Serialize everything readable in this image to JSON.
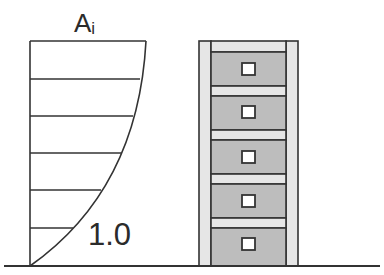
{
  "diagram": {
    "distribution_label": "A",
    "distribution_subscript": "i",
    "base_value_label": "1.0",
    "colors": {
      "stroke": "#333333",
      "panel": "#bdbdbd",
      "band": "#e6e6e6",
      "window": "#ffffff",
      "background": "#ffffff"
    },
    "distribution": {
      "axis_x": 30,
      "top_y": 41,
      "base_y": 266,
      "levels": [
        {
          "y": 41,
          "end_x": 146
        },
        {
          "y": 79,
          "end_x": 140
        },
        {
          "y": 116,
          "end_x": 133
        },
        {
          "y": 153,
          "end_x": 121
        },
        {
          "y": 190,
          "end_x": 101
        },
        {
          "y": 228,
          "end_x": 73
        }
      ]
    },
    "building": {
      "floors": 5,
      "outer_left": 199,
      "outer_right": 298,
      "inner_left": 211,
      "inner_right": 286,
      "top_y": 41,
      "base_y": 266
    },
    "ground": {
      "x1": 4,
      "x2": 380,
      "y": 266
    }
  }
}
